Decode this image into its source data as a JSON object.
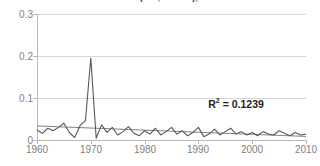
{
  "chart_data": {
    "type": "line",
    "title": "… death count (ICD, Mexico), 1960–2010",
    "title_note": "Chart title is cropped off the top edge of the screenshot; only the lower pixel row of the glyphs is visible.",
    "xlabel": "",
    "ylabel": "",
    "xlim": [
      1960,
      2010
    ],
    "ylim": [
      0,
      0.3
    ],
    "grid": true,
    "legend": false,
    "y_ticks": [
      "0",
      "0.1",
      "0.2",
      "0.3"
    ],
    "y_tick_values": [
      0,
      0.1,
      0.2,
      0.3
    ],
    "x_ticks": [
      "1960",
      "1970",
      "1980",
      "1990",
      "2000",
      "2010"
    ],
    "x_tick_values": [
      1960,
      1970,
      1980,
      1990,
      2000,
      2010
    ],
    "x": [
      1960,
      1961,
      1962,
      1963,
      1964,
      1965,
      1966,
      1967,
      1968,
      1969,
      1970,
      1971,
      1972,
      1973,
      1974,
      1975,
      1976,
      1977,
      1978,
      1979,
      1980,
      1981,
      1982,
      1983,
      1984,
      1985,
      1986,
      1987,
      1988,
      1989,
      1990,
      1991,
      1992,
      1993,
      1994,
      1995,
      1996,
      1997,
      1998,
      1999,
      2000,
      2001,
      2002,
      2003,
      2004,
      2005,
      2006,
      2007,
      2008,
      2009,
      2010
    ],
    "series": [
      {
        "name": "observed",
        "color": "#595959",
        "values": [
          0.024,
          0.016,
          0.028,
          0.022,
          0.03,
          0.04,
          0.018,
          0.006,
          0.034,
          0.046,
          0.195,
          0.004,
          0.036,
          0.018,
          0.03,
          0.012,
          0.02,
          0.032,
          0.016,
          0.01,
          0.022,
          0.014,
          0.028,
          0.012,
          0.02,
          0.03,
          0.014,
          0.022,
          0.01,
          0.018,
          0.03,
          0.008,
          0.014,
          0.026,
          0.012,
          0.02,
          0.028,
          0.014,
          0.02,
          0.012,
          0.018,
          0.01,
          0.02,
          0.014,
          0.012,
          0.022,
          0.016,
          0.01,
          0.018,
          0.012,
          0.014
        ]
      },
      {
        "name": "linear-trend",
        "color": "#7f7f7f",
        "values": [
          0.0335,
          0.033,
          0.0325,
          0.032,
          0.0315,
          0.031,
          0.0305,
          0.03,
          0.0295,
          0.029,
          0.0285,
          0.028,
          0.0275,
          0.027,
          0.0265,
          0.026,
          0.0255,
          0.025,
          0.0245,
          0.024,
          0.0235,
          0.023,
          0.0225,
          0.022,
          0.0215,
          0.021,
          0.0205,
          0.02,
          0.0195,
          0.019,
          0.0185,
          0.018,
          0.0175,
          0.017,
          0.0165,
          0.016,
          0.0155,
          0.015,
          0.0145,
          0.014,
          0.0135,
          0.013,
          0.0125,
          0.012,
          0.0115,
          0.011,
          0.0105,
          0.01,
          0.0095,
          0.009,
          0.0085
        ]
      }
    ],
    "annotations": [
      {
        "id": "r-squared",
        "text": "R² = 0.1239",
        "r_label": "R",
        "r_exponent": "2",
        "r_value": "= 0.1239",
        "x": 2001.5,
        "y": 0.085
      }
    ],
    "peak": {
      "year": 1970,
      "value": 0.195
    },
    "colors": {
      "series": "#595959",
      "trend": "#7f7f7f",
      "grid": "#d6d6d6",
      "axis": "#b9b9b9",
      "tick_text": "#808080",
      "annotation_text": "#222222",
      "background": "#ffffff"
    }
  }
}
